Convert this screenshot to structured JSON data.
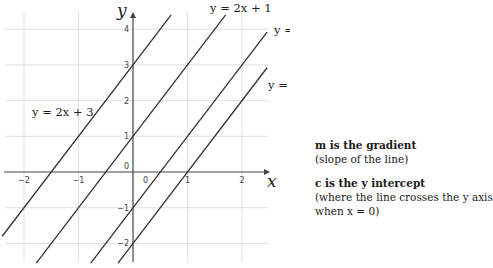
{
  "chart_data": {
    "type": "line",
    "title": "",
    "xlabel": "x",
    "ylabel": "y",
    "xlim": [
      -2.4,
      2.5
    ],
    "ylim": [
      -2.6,
      4.5
    ],
    "grid": true,
    "x_ticks": [
      "-2",
      "-1",
      "0",
      "1",
      "2"
    ],
    "y_ticks": [
      "4",
      "3",
      "2",
      "1",
      "0",
      "-1",
      "-2"
    ],
    "series": [
      {
        "name": "y = 2x + 3",
        "slope": 2,
        "intercept": 3
      },
      {
        "name": "y = 2x + 1",
        "slope": 2,
        "intercept": 1
      },
      {
        "name": "y = 2x − 1",
        "slope": 2,
        "intercept": -1
      },
      {
        "name": "y = 2x − 2",
        "slope": 2,
        "intercept": -2
      }
    ],
    "legend": "inline labels"
  },
  "labels": {
    "eq1": "y = 2x + 3",
    "eq2": "y = 2x + 1",
    "eq3": "y = 2x − 1",
    "eq4": "y = 2x − 2",
    "x_axis": "x",
    "y_axis": "y",
    "origin_left": "0",
    "origin_right": "0"
  },
  "notes": {
    "gradient_title": "m is the gradient",
    "gradient_desc": "(slope of the line)",
    "intercept_title": "c is the y intercept",
    "intercept_desc1": "(where the line crosses the y axis",
    "intercept_desc2": "when x = 0)"
  }
}
